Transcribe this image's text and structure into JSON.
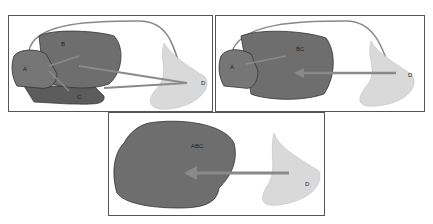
{
  "panels": [
    {
      "id": "panel-1",
      "labels": {
        "A": "A",
        "B": "B",
        "C": "C",
        "D": "D"
      }
    },
    {
      "id": "panel-2",
      "labels": {
        "A": "A",
        "BC": "BC",
        "D": "D"
      }
    },
    {
      "id": "panel-3",
      "labels": {
        "ABC": "ABC",
        "D": "D"
      }
    }
  ],
  "colors": {
    "region_dark": "#6e6e6e",
    "region_d": "#d9d9d9",
    "arrow": "#8a8a8a",
    "outline": "#555555"
  }
}
